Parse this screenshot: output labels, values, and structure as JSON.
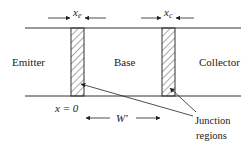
{
  "diagram": {
    "type": "bipolar-transistor-cross-section",
    "regions": {
      "emitter": "Emitter",
      "base": "Base",
      "collector": "Collector"
    },
    "widths": {
      "emitter_junction": "x",
      "emitter_junction_sub": "e",
      "collector_junction": "x",
      "collector_junction_sub": "c",
      "base_width": "W′"
    },
    "origin_label": "x = 0",
    "junction_label": {
      "line1": "Junction",
      "line2": "regions"
    },
    "colors": {
      "line": "#333333",
      "hatch": "#555555",
      "text": "#222222",
      "background": "#ffffff"
    }
  }
}
